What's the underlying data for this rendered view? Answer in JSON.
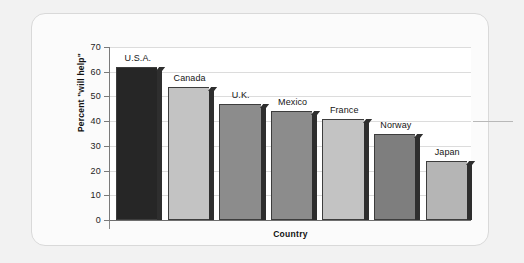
{
  "chart_data": {
    "type": "bar",
    "title": "",
    "subtitle": "",
    "xlabel": "Country",
    "ylabel": "Percent \"will help\"",
    "categories": [
      "U.S.A.",
      "Canada",
      "U.K.",
      "Mexico",
      "France",
      "Norway",
      "Japan"
    ],
    "values": [
      62,
      54,
      47,
      44,
      41,
      35,
      24
    ],
    "ylim": [
      0,
      70
    ],
    "yticks": [
      0,
      10,
      20,
      30,
      40,
      50,
      60,
      70
    ],
    "ytick_labels": [
      "0",
      "10",
      "20",
      "30",
      "40",
      "50",
      "60",
      "70"
    ],
    "grid": true,
    "grid_axis": "y",
    "legend": false,
    "legend_position": "none",
    "bar_labels_position": "above-bar",
    "bar_colors": [
      "#262626",
      "#c3c3c3",
      "#8c8c8c",
      "#8c8c8c",
      "#c3c3c3",
      "#7e7e7e",
      "#b5b5b5"
    ],
    "bar_edge_color": "#3d3d3d",
    "bar_side_color": "#2e2e2e",
    "plot_background": "#ffffff",
    "card_background": "#fbfbfb",
    "page_background": "#f2f2f2",
    "axis_color": "#7a7a7a",
    "gridline_color": "#dcdcdc"
  }
}
